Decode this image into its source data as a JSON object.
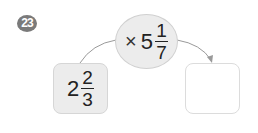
{
  "problem": {
    "number": "23",
    "operation": {
      "operator": "×",
      "whole": "5",
      "numerator": "1",
      "denominator": "7"
    },
    "input": {
      "whole": "2",
      "numerator": "2",
      "denominator": "3"
    },
    "answer": ""
  },
  "colors": {
    "shape_fill": "#ececec",
    "badge": "#7a7a7a",
    "arrow": "#9a9a9a"
  }
}
